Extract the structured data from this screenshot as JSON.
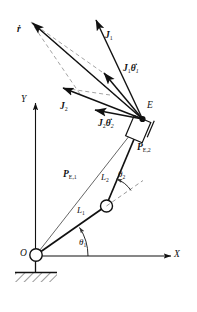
{
  "figure": {
    "kind": "kinematics-diagram",
    "background": "#ffffff",
    "line_color": "#111111",
    "dashed_color": "#9a9a9a"
  },
  "axes": {
    "x_label": "X",
    "y_label": "Y",
    "origin_label": "O"
  },
  "points": {
    "end_effector_label": "E"
  },
  "links": {
    "link1_label": "L",
    "link1_sub": "1",
    "link2_label": "L",
    "link2_sub": "2"
  },
  "angles": {
    "theta1_label": "θ",
    "theta1_sub": "1",
    "theta2_label": "θ",
    "theta2_sub": "2"
  },
  "vectors": {
    "rdot_label": "ṙ",
    "j1_label": "J",
    "j1_sub": "1",
    "j1_thetadot_label": "J",
    "j1_thetadot_sub": "1",
    "j1_thetadot_term": "θ̇",
    "j1_thetadot_term_sub": "1",
    "j2_label": "J",
    "j2_sub": "2",
    "j2_thetadot_label": "J",
    "j2_thetadot_sub": "2",
    "j2_thetadot_term": "θ̇",
    "j2_thetadot_term_sub": "2",
    "pe1_label": "P",
    "pe1_sub": "E,1",
    "pe2_label": "P",
    "pe2_sub": "E,2"
  },
  "caption": {
    "text": ""
  }
}
